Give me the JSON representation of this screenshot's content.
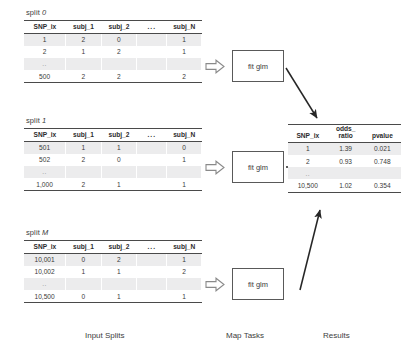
{
  "diagram": {
    "columns": {
      "input_splits_label": "Input Splits",
      "map_tasks_label": "Map Tasks",
      "results_label": "Results"
    },
    "map_task_label": "fit glm",
    "dots_cell": "..",
    "header_dots": "...",
    "split_table_headers": [
      "SNP_ix",
      "subj_1",
      "subj_2",
      "...",
      "subj_N"
    ],
    "splits": [
      {
        "title_prefix": "split ",
        "title_index": "0",
        "rows": [
          [
            "1",
            "2",
            "0",
            "",
            "1"
          ],
          [
            "2",
            "1",
            "2",
            "",
            "1"
          ],
          [
            "..",
            "",
            "",
            "",
            ""
          ],
          [
            "500",
            "2",
            "2",
            "",
            "2"
          ]
        ]
      },
      {
        "title_prefix": "split ",
        "title_index": "1",
        "rows": [
          [
            "501",
            "1",
            "1",
            "",
            "0"
          ],
          [
            "502",
            "2",
            "0",
            "",
            "1"
          ],
          [
            "..",
            "",
            "",
            "",
            ""
          ],
          [
            "1,000",
            "2",
            "1",
            "",
            "1"
          ]
        ]
      },
      {
        "title_prefix": "split ",
        "title_index": "M",
        "rows": [
          [
            "10,001",
            "0",
            "2",
            "",
            "1"
          ],
          [
            "10,002",
            "1",
            "1",
            "",
            "2"
          ],
          [
            "..",
            "",
            "",
            "",
            ""
          ],
          [
            "10,500",
            "0",
            "1",
            "",
            "1"
          ]
        ]
      }
    ],
    "results_table": {
      "headers": [
        "SNP_ix",
        "odds_\nratio",
        "pvalue"
      ],
      "header_snp": "SNP_ix",
      "header_or_line1": "odds_",
      "header_or_line2": "ratio",
      "header_pvalue": "pvalue",
      "rows": [
        [
          "1",
          "1.39",
          "0.021"
        ],
        [
          "2",
          "0.93",
          "0.748"
        ],
        [
          "..",
          "",
          ""
        ],
        [
          "10,500",
          "1.02",
          "0.354"
        ]
      ]
    },
    "colors": {
      "row_shade": "#ececed",
      "rule": "#4a4a4a",
      "box_border": "#595959",
      "arrow": "#262626",
      "block_arrow_outline": "#8a8a8a",
      "text": "#3a3a3a"
    }
  }
}
